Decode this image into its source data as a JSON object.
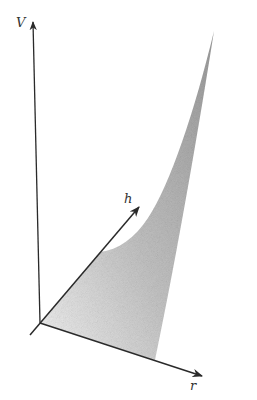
{
  "diagram": {
    "type": "3d-surface-sketch",
    "axes": [
      {
        "name": "V",
        "label": "V",
        "direction": "vertical"
      },
      {
        "name": "h",
        "label": "h",
        "direction": "depth"
      },
      {
        "name": "r",
        "label": "r",
        "direction": "horizontal"
      }
    ],
    "region": {
      "description": "shaded surface region bounded by h-axis, r-axis, a concave curve, and a rising edge",
      "fill": "#a8a8a8"
    },
    "colors": {
      "axis": "#2a2a2a",
      "shade_light": "#f0f0f0",
      "shade_dark": "#9a9a9a",
      "background": "#ffffff"
    }
  }
}
